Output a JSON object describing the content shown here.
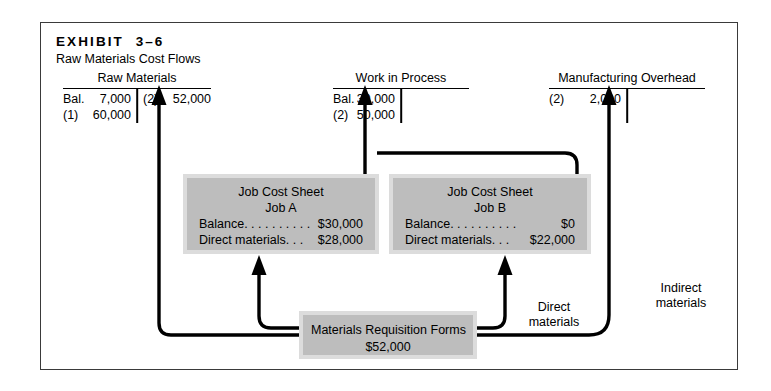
{
  "exhibit": {
    "label": "EXHIBIT  3–6",
    "subtitle": "Raw Materials Cost Flows"
  },
  "accounts": [
    {
      "name": "raw-materials",
      "title": "Raw Materials",
      "debits": [
        {
          "ref": "Bal.",
          "amount": "7,000"
        },
        {
          "ref": "(1)",
          "amount": "60,000"
        }
      ],
      "credits": [
        {
          "ref": "(2)",
          "amount": "52,000"
        }
      ]
    },
    {
      "name": "work-in-process",
      "title": "Work in Process",
      "debits": [
        {
          "ref": "Bal.",
          "amount": "30,000"
        },
        {
          "ref": "(2)",
          "amount": "50,000"
        }
      ],
      "credits": []
    },
    {
      "name": "manufacturing-overhead",
      "title": "Manufacturing Overhead",
      "debits": [
        {
          "ref": "(2)",
          "amount": "2,000"
        }
      ],
      "credits": []
    }
  ],
  "job_sheets": [
    {
      "name": "job-a",
      "title": "Job Cost Sheet",
      "job": "Job A",
      "rows": [
        {
          "label": "Balance. . . . . . . . . .",
          "value": "$30,000"
        },
        {
          "label": "Direct materials. . .",
          "value": "$28,000"
        }
      ]
    },
    {
      "name": "job-b",
      "title": "Job Cost Sheet",
      "job": "Job B",
      "rows": [
        {
          "label": "Balance. . . . . . . . . .",
          "value": "$0"
        },
        {
          "label": "Direct materials. . .",
          "value": "$22,000"
        }
      ]
    }
  ],
  "materials_requisition": {
    "title": "Materials Requisition Forms",
    "amount": "$52,000"
  },
  "flow_labels": {
    "direct": "Direct\nmaterials",
    "indirect": "Indirect\nmaterials"
  },
  "colors": {
    "panel_fill": "#bdbdbd",
    "panel_frame": "#dcdcdc",
    "border": "#3a3a3a",
    "line": "#000000"
  }
}
